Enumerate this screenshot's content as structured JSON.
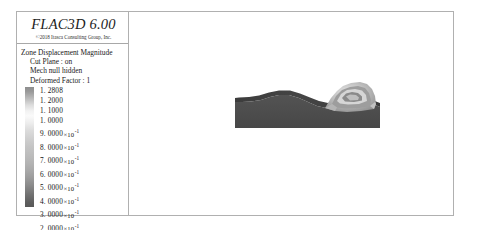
{
  "legend": {
    "app_title": "FLAC3D 6.00",
    "copyright": "©2018 Itasca Consulting Group, Inc.",
    "heading": "Zone Displacement Magnitude",
    "info_lines": [
      "Cut Plane : on",
      "Mech  null hidden",
      "Deformed Factor : 1"
    ],
    "colorbar": {
      "top_color": "#8e8e8e",
      "mid_color": "#fafafa",
      "bottom_color": "#585858"
    },
    "ticks": [
      {
        "mantissa": "1. 2808",
        "times": "",
        "exponent": ""
      },
      {
        "mantissa": "1. 2000",
        "times": "",
        "exponent": ""
      },
      {
        "mantissa": "1. 1000",
        "times": "",
        "exponent": ""
      },
      {
        "mantissa": "1. 0000",
        "times": "",
        "exponent": ""
      },
      {
        "mantissa": "9. 0000",
        "times": "×10",
        "exponent": "-1"
      },
      {
        "mantissa": "8. 0000",
        "times": "×10",
        "exponent": "-1"
      },
      {
        "mantissa": "7. 0000",
        "times": "×10",
        "exponent": "-1"
      },
      {
        "mantissa": "6. 0000",
        "times": "×10",
        "exponent": "-1"
      },
      {
        "mantissa": "5. 0000",
        "times": "×10",
        "exponent": "-1"
      },
      {
        "mantissa": "4. 0000",
        "times": "×10",
        "exponent": "-1"
      },
      {
        "mantissa": "3. 0000",
        "times": "×10",
        "exponent": "-1"
      },
      {
        "mantissa": "2. 0000",
        "times": "×10",
        "exponent": "-1"
      },
      {
        "mantissa": "1. 0000",
        "times": "×10",
        "exponent": "-1"
      },
      {
        "mantissa": "0. 0000",
        "times": "",
        "exponent": ""
      }
    ]
  },
  "model": {
    "description": "Deformed terrain block with crater feature",
    "block_color": "#4a4a4a",
    "top_surface_color": "#3f3f3f",
    "crater_light_color": "#d8d8d8",
    "crater_mid_color": "#a5a5a5",
    "crater_dark_color": "#6e6e6e"
  }
}
